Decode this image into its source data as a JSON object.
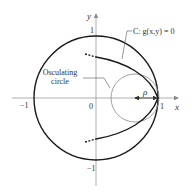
{
  "diagram": {
    "axes": {
      "x_label": "x",
      "y_label": "y",
      "origin_label": "0",
      "x_pos_tick": "1",
      "x_neg_tick": "−1",
      "y_pos_tick": "1",
      "y_neg_tick": "−1"
    },
    "curve_label": "C: g(x,y) = 0",
    "osculating_label_line1": "Osculating",
    "osculating_label_line2": "circle",
    "radius_label": "ρ",
    "colors": {
      "curve": "#1a1a1a",
      "unit_circle": "#1a1a1a",
      "osculating_circle": "#8a8a8a",
      "axes": "#9a9a9a",
      "text": "#333333"
    }
  }
}
